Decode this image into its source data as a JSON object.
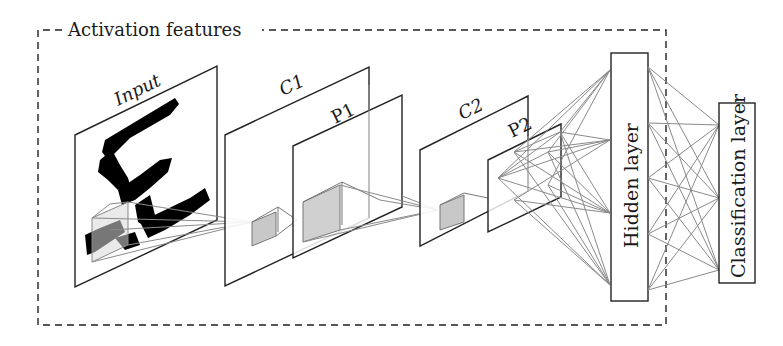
{
  "frame": {
    "title": "Activation features",
    "style": "dashed",
    "color": "#222222"
  },
  "layers": {
    "input": {
      "label": "Input"
    },
    "c1": {
      "label": "C1"
    },
    "p1": {
      "label": "P1"
    },
    "c2": {
      "label": "C2"
    },
    "p2": {
      "label": "P2"
    },
    "hidden": {
      "label": "Hidden layer"
    },
    "classification": {
      "label": "Classification layer"
    }
  },
  "colors": {
    "line": "#222222",
    "connection": "#8a8a8a",
    "receptive_field_fill": "#c8c8c8",
    "digit": "#000000",
    "background": "#ffffff"
  }
}
